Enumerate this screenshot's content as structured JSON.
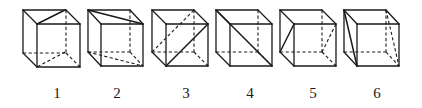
{
  "figure": {
    "cubes": [
      {
        "label": "1",
        "back": [
          23,
          10
        ],
        "front": [
          37,
          24
        ],
        "size": 43,
        "solid_diagonals": [
          [
            [
              65,
              10
            ],
            [
              37,
              24
            ]
          ]
        ],
        "dashed_diagonals": [
          [
            [
              65,
              52
            ],
            [
              37,
              67
            ]
          ]
        ]
      },
      {
        "label": "2",
        "back": [
          88,
          10
        ],
        "front": [
          101,
          24
        ],
        "size": 42,
        "solid_diagonals": [
          [
            [
              88,
              10
            ],
            [
              143,
              24
            ]
          ]
        ],
        "dashed_diagonals": [
          [
            [
              88,
              52
            ],
            [
              143,
              66
            ]
          ]
        ]
      },
      {
        "label": "3",
        "back": [
          152,
          10
        ],
        "front": [
          166,
          24
        ],
        "size": 42,
        "solid_diagonals": [
          [
            [
              166,
              66
            ],
            [
              208,
              24
            ]
          ]
        ],
        "dashed_diagonals": [
          [
            [
              152,
              52
            ],
            [
              194,
              10
            ]
          ]
        ]
      },
      {
        "label": "4",
        "back": [
          216,
          10
        ],
        "front": [
          230,
          24
        ],
        "size": 42,
        "solid_diagonals": [
          [
            [
              216,
              10
            ],
            [
              230,
              24
            ]
          ],
          [
            [
              230,
              24
            ],
            [
              272,
              66
            ]
          ]
        ],
        "dashed_diagonals": []
      },
      {
        "label": "5",
        "back": [
          280,
          10
        ],
        "front": [
          294,
          24
        ],
        "size": 42,
        "solid_diagonals": [
          [
            [
              280,
              52
            ],
            [
              294,
              24
            ]
          ]
        ],
        "dashed_diagonals": [
          [
            [
              322,
              52
            ],
            [
              336,
              24
            ]
          ]
        ]
      },
      {
        "label": "6",
        "back": [
          344,
          10
        ],
        "front": [
          357,
          24
        ],
        "size": 42,
        "solid_diagonals": [
          [
            [
              344,
              10
            ],
            [
              357,
              66
            ]
          ]
        ],
        "dashed_diagonals": [
          [
            [
              386,
              10
            ],
            [
              399,
              66
            ]
          ]
        ]
      }
    ],
    "labels": [
      "1",
      "2",
      "3",
      "4",
      "5",
      "6"
    ],
    "label_positions_x": [
      57,
      117,
      186,
      250,
      313,
      377
    ],
    "label_y": 98,
    "line_color": "#1a1a1a",
    "background": "#ffffff"
  }
}
